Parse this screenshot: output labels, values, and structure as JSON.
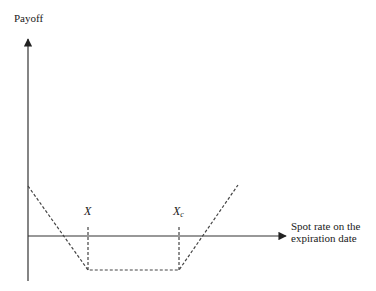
{
  "diagram": {
    "type": "option-payoff",
    "y_axis_label": "Payoff",
    "x_axis_label_line1": "Spot rate on the",
    "x_axis_label_line2": "expiration date",
    "strike_labels": [
      {
        "base": "X",
        "sub": ""
      },
      {
        "base": "X",
        "sub": "c"
      }
    ],
    "colors": {
      "axis": "#333333",
      "payoff_line": "#444444",
      "text": "#1a1a1a"
    },
    "payoff_points": [
      {
        "x": 28,
        "y": 186
      },
      {
        "x": 88,
        "y": 270
      },
      {
        "x": 179,
        "y": 270
      },
      {
        "x": 238,
        "y": 185
      }
    ]
  }
}
